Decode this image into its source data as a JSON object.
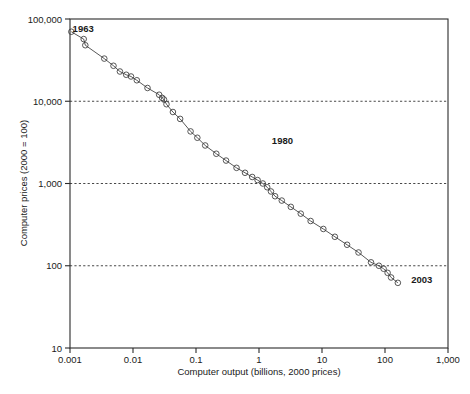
{
  "chart_data": {
    "type": "line",
    "title": "",
    "xlabel": "Computer output (billions, 2000 prices)",
    "ylabel": "Computer prices (2000 = 100)",
    "xscale": "log",
    "yscale": "log",
    "xlim": [
      0.001,
      1000
    ],
    "ylim": [
      10,
      100000
    ],
    "xticks": [
      "0.001",
      "0.01",
      "0.1",
      "1",
      "10",
      "100",
      "1,000"
    ],
    "xtick_values": [
      0.001,
      0.01,
      0.1,
      1,
      10,
      100,
      1000
    ],
    "yticks": [
      "10",
      "100",
      "1,000",
      "10,000",
      "100,000"
    ],
    "ytick_values": [
      10,
      100,
      1000,
      10000,
      100000
    ],
    "grid": "horizontal dashed at 100, 1,000, 10,000",
    "gridlines": [
      100,
      1000,
      10000
    ],
    "marker": "open-circle",
    "legend": "none",
    "annotations": [
      {
        "label": "1963",
        "x": 0.0011,
        "y": 70000
      },
      {
        "label": "1980",
        "x": 1.6,
        "y": 3000
      },
      {
        "label": "2003",
        "x": 260,
        "y": 62
      }
    ],
    "series": [
      {
        "name": "Computer price vs output",
        "points": [
          {
            "year": 1963,
            "x": 0.00105,
            "y": 70000
          },
          {
            "year": 1964,
            "x": 0.00165,
            "y": 57000
          },
          {
            "year": 1965,
            "x": 0.00175,
            "y": 48000
          },
          {
            "year": 1966,
            "x": 0.0035,
            "y": 33000
          },
          {
            "year": 1967,
            "x": 0.0049,
            "y": 27000
          },
          {
            "year": 1968,
            "x": 0.0062,
            "y": 23000
          },
          {
            "year": 1969,
            "x": 0.0078,
            "y": 21000
          },
          {
            "year": 1970,
            "x": 0.0093,
            "y": 20000
          },
          {
            "year": 1971,
            "x": 0.0115,
            "y": 18000
          },
          {
            "year": 1972,
            "x": 0.017,
            "y": 14500
          },
          {
            "year": 1973,
            "x": 0.026,
            "y": 12000
          },
          {
            "year": 1974,
            "x": 0.029,
            "y": 11000
          },
          {
            "year": 1975,
            "x": 0.031,
            "y": 10500
          },
          {
            "year": 1976,
            "x": 0.034,
            "y": 9200
          },
          {
            "year": 1977,
            "x": 0.043,
            "y": 7400
          },
          {
            "year": 1978,
            "x": 0.056,
            "y": 6100
          },
          {
            "year": 1979,
            "x": 0.082,
            "y": 4300
          },
          {
            "year": 1980,
            "x": 0.105,
            "y": 3600
          },
          {
            "year": 1981,
            "x": 0.14,
            "y": 2900
          },
          {
            "year": 1982,
            "x": 0.21,
            "y": 2300
          },
          {
            "year": 1983,
            "x": 0.3,
            "y": 1900
          },
          {
            "year": 1984,
            "x": 0.44,
            "y": 1550
          },
          {
            "year": 1985,
            "x": 0.6,
            "y": 1350
          },
          {
            "year": 1986,
            "x": 0.78,
            "y": 1200
          },
          {
            "year": 1987,
            "x": 0.95,
            "y": 1100
          },
          {
            "year": 1988,
            "x": 1.15,
            "y": 1000
          },
          {
            "year": 1989,
            "x": 1.35,
            "y": 900
          },
          {
            "year": 1990,
            "x": 1.55,
            "y": 800
          },
          {
            "year": 1991,
            "x": 1.8,
            "y": 700
          },
          {
            "year": 1992,
            "x": 2.3,
            "y": 620
          },
          {
            "year": 1993,
            "x": 3.2,
            "y": 520
          },
          {
            "year": 1994,
            "x": 4.6,
            "y": 430
          },
          {
            "year": 1995,
            "x": 6.6,
            "y": 350
          },
          {
            "year": 1996,
            "x": 10.5,
            "y": 280
          },
          {
            "year": 1997,
            "x": 16,
            "y": 225
          },
          {
            "year": 1998,
            "x": 25,
            "y": 180
          },
          {
            "year": 1999,
            "x": 38,
            "y": 145
          },
          {
            "year": 2000,
            "x": 60,
            "y": 110
          },
          {
            "year": 2001,
            "x": 80,
            "y": 100
          },
          {
            "year": 2002,
            "x": 95,
            "y": 92
          },
          {
            "year": 2003,
            "x": 110,
            "y": 82
          },
          {
            "year": 2004,
            "x": 125,
            "y": 72
          },
          {
            "year": 2005,
            "x": 160,
            "y": 62
          }
        ]
      }
    ]
  },
  "caption": {
    "text": ""
  }
}
